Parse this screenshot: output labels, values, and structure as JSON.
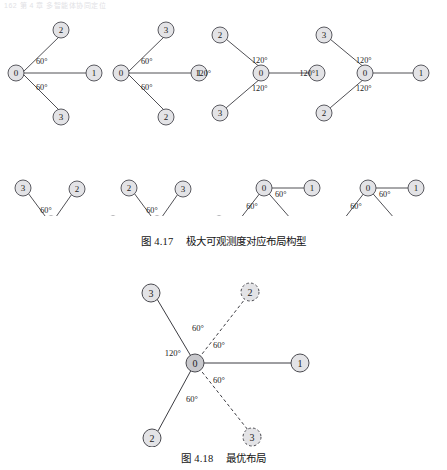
{
  "page": {
    "running_head": "162    第 4 章  多智能体协同定位"
  },
  "figures": [
    {
      "id": "fig-417",
      "caption_prefix": "图",
      "caption_number": "4.17",
      "caption_text": "极大可观测度对应布局构型",
      "layouts": [
        {
          "name": "layout-a",
          "nodes": [
            {
              "label": "0",
              "style": "solid"
            },
            {
              "label": "1",
              "style": "solid"
            },
            {
              "label": "2",
              "style": "solid"
            },
            {
              "label": "3",
              "style": "solid"
            }
          ],
          "angles": [
            "60°",
            "60°"
          ]
        },
        {
          "name": "layout-b",
          "nodes": [
            {
              "label": "0",
              "style": "solid"
            },
            {
              "label": "1",
              "style": "solid"
            },
            {
              "label": "3",
              "style": "solid"
            },
            {
              "label": "2",
              "style": "solid"
            }
          ],
          "angles": [
            "60°",
            "60°"
          ]
        },
        {
          "name": "layout-c",
          "nodes": [
            {
              "label": "0",
              "style": "solid"
            },
            {
              "label": "1",
              "style": "solid"
            },
            {
              "label": "2",
              "style": "solid"
            },
            {
              "label": "3",
              "style": "solid"
            }
          ],
          "angles": [
            "120°",
            "120°",
            "120°"
          ]
        },
        {
          "name": "layout-d",
          "nodes": [
            {
              "label": "0",
              "style": "solid"
            },
            {
              "label": "1",
              "style": "solid"
            },
            {
              "label": "3",
              "style": "solid"
            },
            {
              "label": "2",
              "style": "solid"
            }
          ],
          "angles": [
            "120°",
            "120°",
            "120°"
          ]
        },
        {
          "name": "layout-e",
          "nodes": [
            {
              "label": "0",
              "style": "solid"
            },
            {
              "label": "1",
              "style": "solid"
            },
            {
              "label": "3",
              "style": "solid"
            },
            {
              "label": "2",
              "style": "solid"
            }
          ],
          "angles": [
            "60°",
            "60°"
          ]
        },
        {
          "name": "layout-f",
          "nodes": [
            {
              "label": "0",
              "style": "solid"
            },
            {
              "label": "1",
              "style": "solid"
            },
            {
              "label": "2",
              "style": "solid"
            },
            {
              "label": "3",
              "style": "solid"
            }
          ],
          "angles": [
            "60°",
            "60°"
          ]
        },
        {
          "name": "layout-g",
          "nodes": [
            {
              "label": "0",
              "style": "solid"
            },
            {
              "label": "1",
              "style": "solid"
            },
            {
              "label": "3",
              "style": "solid"
            },
            {
              "label": "2",
              "style": "solid"
            }
          ],
          "angles": [
            "60°",
            "60°"
          ]
        },
        {
          "name": "layout-h",
          "nodes": [
            {
              "label": "0",
              "style": "solid"
            },
            {
              "label": "1",
              "style": "solid"
            },
            {
              "label": "2",
              "style": "solid"
            },
            {
              "label": "3",
              "style": "solid"
            }
          ],
          "angles": [
            "60°",
            "60°"
          ]
        }
      ]
    },
    {
      "id": "fig-418",
      "caption_prefix": "图",
      "caption_number": "4.18",
      "caption_text": "最优布局",
      "optimal": {
        "nodes": [
          {
            "label": "0",
            "style": "solid",
            "role": "center"
          },
          {
            "label": "1",
            "style": "solid",
            "role": "anchor-right"
          },
          {
            "label": "3",
            "style": "solid",
            "role": "anchor-upper-left"
          },
          {
            "label": "2",
            "style": "solid",
            "role": "anchor-lower-left"
          },
          {
            "label": "2",
            "style": "dashed",
            "role": "alt-upper-right"
          },
          {
            "label": "3",
            "style": "dashed",
            "role": "alt-lower-right"
          }
        ],
        "angles": [
          "60°",
          "60°",
          "120°",
          "60°",
          "60°"
        ]
      }
    }
  ],
  "labels": {
    "n0": "0",
    "n1": "1",
    "n2": "2",
    "n3": "3",
    "a60": "60°",
    "a120": "120°"
  },
  "colors": {
    "node_fill": "#e3e3e6",
    "node_stroke": "#4a4a50",
    "edge": "#3c3c42",
    "text": "#1c1c1c",
    "page_bg": "#ffffff"
  }
}
